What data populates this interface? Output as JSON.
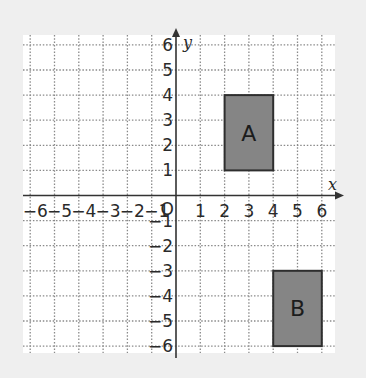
{
  "diagram": {
    "type": "coordinate-grid",
    "x_axis": {
      "label": "x",
      "min": -6,
      "max": 6,
      "tick_labels": [
        "−6",
        "−5",
        "−4",
        "−3",
        "−2",
        "−1",
        "1",
        "2",
        "3",
        "4",
        "5",
        "6"
      ]
    },
    "y_axis": {
      "label": "y",
      "min": -6,
      "max": 6,
      "tick_labels": [
        "6",
        "5",
        "4",
        "3",
        "2",
        "1",
        "−1",
        "−2",
        "−3",
        "−4",
        "−5",
        "−6"
      ]
    },
    "origin_label": "O",
    "shapes": [
      {
        "name": "A",
        "x1": 2,
        "y1": 1,
        "x2": 4,
        "y2": 4
      },
      {
        "name": "B",
        "x1": 4,
        "y1": -6,
        "x2": 6,
        "y2": -3
      }
    ],
    "colors": {
      "background": "#efefef",
      "plot_area": "#ffffff",
      "grid": "#8a8a8a",
      "axis": "#333333",
      "shape_fill": "#858585",
      "shape_stroke": "#2e2e2e"
    }
  }
}
